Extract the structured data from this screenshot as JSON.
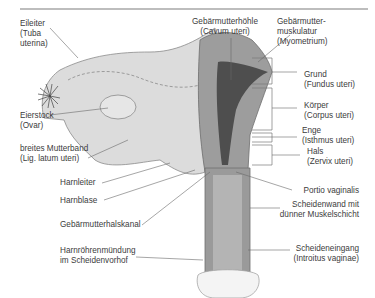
{
  "figure": {
    "colors": {
      "rule": "#bdbdbd",
      "tissue_light": "#dcdcdc",
      "tissue_mid": "#a9a9a9",
      "tissue_dark": "#7c7c7c",
      "cavity": "#4a4a4a",
      "line": "#555555"
    },
    "labels": {
      "eileiter": {
        "line1": "Eileiter",
        "line2": "(Tuba",
        "line3": "uterina)"
      },
      "cavum": {
        "line1": "Gebärmutterhöhle",
        "line2": "(Cavum uteri)"
      },
      "myometrium": {
        "line1": "Gebärmutter-",
        "line2": "muskulatur",
        "line3": "(Myometrium)"
      },
      "grund": {
        "line1": "Grund",
        "line2": "(Fundus uteri)"
      },
      "koerper": {
        "line1": "Körper",
        "line2": "(Corpus uteri)"
      },
      "enge": {
        "line1": "Enge",
        "line2": "(Isthmus uteri)"
      },
      "hals": {
        "line1": "Hals",
        "line2": "(Zervix uteri)"
      },
      "eierstock": {
        "line1": "Eierstock",
        "line2": "(Ovar)"
      },
      "mutterband": {
        "line1": "breites Mutterband",
        "line2": "(Lig. latum uteri)"
      },
      "harnleiter": {
        "line1": "Harnleiter"
      },
      "harnblase": {
        "line1": "Harnblase"
      },
      "halskanal": {
        "line1": "Gebärmutterhalskanal"
      },
      "portio": {
        "line1": "Portio vaginalis"
      },
      "scheidenwand": {
        "line1": "Scheidenwand mit",
        "line2": "dünner Muskelschicht"
      },
      "harnroehre": {
        "line1": "Harnröhrenmündung",
        "line2": "im Scheidenvorhof"
      },
      "scheideneingang": {
        "line1": "Scheideneingang",
        "line2": "(Introitus vaginae)"
      }
    }
  }
}
